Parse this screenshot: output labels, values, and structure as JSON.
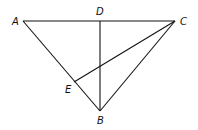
{
  "diagram": {
    "type": "geometry-triangle",
    "points": {
      "A": {
        "label": "A",
        "x": 23,
        "y": 21
      },
      "D": {
        "label": "D",
        "x": 100,
        "y": 21
      },
      "C": {
        "label": "C",
        "x": 175,
        "y": 21
      },
      "E": {
        "label": "E",
        "x": 74,
        "y": 82
      },
      "B": {
        "label": "B",
        "x": 100,
        "y": 111
      }
    },
    "segments": [
      "AC",
      "AB",
      "CB",
      "DB",
      "CE"
    ],
    "line_color": "#111111"
  }
}
